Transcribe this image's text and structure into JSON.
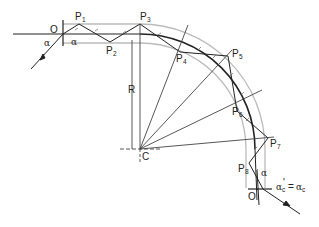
{
  "diagram": {
    "title": "",
    "labels": {
      "O": "O",
      "O_prime": "O'",
      "C": "C",
      "R": "R",
      "P": "P",
      "alpha": "α",
      "alpha_eq_left": "α",
      "alpha_eq_prime": "'",
      "alpha_eq_sign": "=",
      "alpha_eq_right": "α",
      "alpha_sub": "c",
      "points": [
        {
          "name": "P",
          "sub": "1"
        },
        {
          "name": "P",
          "sub": "2"
        },
        {
          "name": "P",
          "sub": "3"
        },
        {
          "name": "P",
          "sub": "4"
        },
        {
          "name": "P",
          "sub": "5"
        },
        {
          "name": "P",
          "sub": "6"
        },
        {
          "name": "P",
          "sub": "7"
        },
        {
          "name": "P",
          "sub": "8"
        }
      ]
    },
    "colors": {
      "ray": "#222222",
      "fiber_outline": "#b8b8b8",
      "construction": "#444444"
    }
  }
}
